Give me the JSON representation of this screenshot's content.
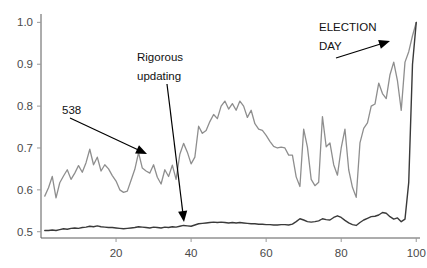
{
  "chart_data": {
    "type": "line",
    "title": "",
    "xlabel": "",
    "ylabel": "",
    "xlim": [
      0,
      101
    ],
    "ylim": [
      0.485,
      1.02
    ],
    "grid": false,
    "legend": "none",
    "x_ticks": [
      20,
      40,
      60,
      80,
      100
    ],
    "x_tick_labels": [
      "20",
      "40",
      "60",
      "80",
      "100"
    ],
    "y_ticks": [
      0.5,
      0.6,
      0.7,
      0.8,
      0.9,
      1.0
    ],
    "y_tick_labels": [
      "0.5",
      "0.6",
      "0.7",
      "0.8",
      "0.9",
      "1.0"
    ],
    "series": [
      {
        "name": "538",
        "color": "#8e8e8e",
        "x": [
          1,
          2,
          3,
          4,
          5,
          6,
          7,
          8,
          9,
          10,
          11,
          12,
          13,
          14,
          15,
          16,
          17,
          18,
          19,
          20,
          21,
          22,
          23,
          24,
          25,
          26,
          27,
          28,
          29,
          30,
          31,
          32,
          33,
          34,
          35,
          36,
          37,
          38,
          39,
          40,
          41,
          42,
          43,
          44,
          45,
          46,
          47,
          48,
          49,
          50,
          51,
          52,
          53,
          54,
          55,
          56,
          57,
          58,
          59,
          60,
          61,
          62,
          63,
          64,
          65,
          66,
          67,
          68,
          69,
          70,
          71,
          72,
          73,
          74,
          75,
          76,
          77,
          78,
          79,
          80,
          81,
          82,
          83,
          84,
          85,
          86,
          87,
          88,
          89,
          90,
          91,
          92,
          93,
          94,
          95,
          96,
          97,
          98,
          99,
          100
        ],
        "values": [
          0.585,
          0.605,
          0.632,
          0.581,
          0.617,
          0.633,
          0.648,
          0.625,
          0.64,
          0.658,
          0.642,
          0.665,
          0.697,
          0.66,
          0.678,
          0.645,
          0.66,
          0.65,
          0.634,
          0.621,
          0.6,
          0.594,
          0.597,
          0.623,
          0.649,
          0.689,
          0.652,
          0.645,
          0.64,
          0.66,
          0.63,
          0.614,
          0.648,
          0.632,
          0.659,
          0.625,
          0.685,
          0.711,
          0.69,
          0.662,
          0.678,
          0.752,
          0.735,
          0.742,
          0.763,
          0.78,
          0.77,
          0.8,
          0.812,
          0.793,
          0.806,
          0.79,
          0.812,
          0.8,
          0.773,
          0.79,
          0.758,
          0.745,
          0.742,
          0.73,
          0.716,
          0.704,
          0.7,
          0.702,
          0.7,
          0.683,
          0.683,
          0.631,
          0.608,
          0.745,
          0.702,
          0.625,
          0.61,
          0.618,
          0.775,
          0.703,
          0.712,
          0.66,
          0.635,
          0.7,
          0.745,
          0.648,
          0.606,
          0.582,
          0.712,
          0.747,
          0.76,
          0.8,
          0.805,
          0.855,
          0.83,
          0.818,
          0.875,
          0.905,
          0.86,
          0.79,
          0.905,
          0.93,
          0.968,
          1.0
        ]
      },
      {
        "name": "other-forecast",
        "color": "#3a3a3a",
        "x": [
          1,
          2,
          3,
          4,
          5,
          6,
          7,
          8,
          9,
          10,
          11,
          12,
          13,
          14,
          15,
          16,
          17,
          18,
          19,
          20,
          21,
          22,
          23,
          24,
          25,
          26,
          27,
          28,
          29,
          30,
          31,
          32,
          33,
          34,
          35,
          36,
          37,
          38,
          39,
          40,
          41,
          42,
          43,
          44,
          45,
          46,
          47,
          48,
          49,
          50,
          51,
          52,
          53,
          54,
          55,
          56,
          57,
          58,
          59,
          60,
          61,
          62,
          63,
          64,
          65,
          66,
          67,
          68,
          69,
          70,
          71,
          72,
          73,
          74,
          75,
          76,
          77,
          78,
          79,
          80,
          81,
          82,
          83,
          84,
          85,
          86,
          87,
          88,
          89,
          90,
          91,
          92,
          93,
          94,
          95,
          96,
          97,
          98,
          99,
          100
        ],
        "values": [
          0.503,
          0.503,
          0.504,
          0.503,
          0.505,
          0.507,
          0.506,
          0.508,
          0.509,
          0.508,
          0.51,
          0.511,
          0.513,
          0.512,
          0.514,
          0.512,
          0.511,
          0.51,
          0.51,
          0.509,
          0.508,
          0.507,
          0.508,
          0.509,
          0.51,
          0.512,
          0.511,
          0.51,
          0.509,
          0.511,
          0.51,
          0.509,
          0.511,
          0.51,
          0.512,
          0.511,
          0.513,
          0.515,
          0.514,
          0.513,
          0.516,
          0.519,
          0.52,
          0.521,
          0.522,
          0.523,
          0.522,
          0.523,
          0.522,
          0.521,
          0.522,
          0.521,
          0.522,
          0.521,
          0.52,
          0.519,
          0.519,
          0.518,
          0.518,
          0.517,
          0.517,
          0.516,
          0.516,
          0.517,
          0.517,
          0.516,
          0.518,
          0.524,
          0.531,
          0.528,
          0.524,
          0.523,
          0.524,
          0.526,
          0.531,
          0.529,
          0.528,
          0.534,
          0.538,
          0.534,
          0.527,
          0.521,
          0.517,
          0.515,
          0.522,
          0.528,
          0.532,
          0.536,
          0.537,
          0.54,
          0.546,
          0.544,
          0.536,
          0.53,
          0.533,
          0.524,
          0.53,
          0.618,
          0.9,
          1.0
        ]
      }
    ],
    "annotations": [
      {
        "id": "538-label",
        "text": "538",
        "target_series": "538",
        "from": {
          "x_px": 70,
          "y_px": 118
        },
        "to": {
          "x_px": 147,
          "y_px": 154
        }
      },
      {
        "id": "rigorous-updating-label",
        "line1": "Rigorous",
        "line2": "updating",
        "target_series": "other-forecast",
        "from": {
          "x_px": 167,
          "y_px": 84
        },
        "to": {
          "x_px": 184,
          "y_px": 222
        }
      },
      {
        "id": "election-day-label",
        "line1": "ELECTION",
        "line2": "DAY",
        "from": {
          "x_px": 336,
          "y_px": 58
        },
        "to": {
          "x_px": 390,
          "y_px": 41
        }
      }
    ]
  }
}
